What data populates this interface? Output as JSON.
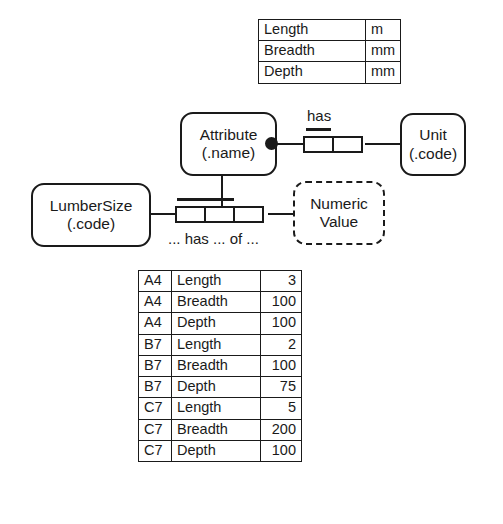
{
  "diagram": {
    "notation": "ORM",
    "line_color": "#1a1a1a",
    "background": "#ffffff"
  },
  "unit_table": {
    "columns": [
      "attribute",
      "unit"
    ],
    "rows": [
      {
        "attribute": "Length",
        "unit": "m"
      },
      {
        "attribute": "Breadth",
        "unit": "mm"
      },
      {
        "attribute": "Depth",
        "unit": "mm"
      }
    ]
  },
  "object_types": {
    "attribute": {
      "name": "Attribute",
      "reference": "(.name)",
      "kind": "entity"
    },
    "unit": {
      "name": "Unit",
      "reference": "(.code)",
      "kind": "entity"
    },
    "lumbersize": {
      "name": "LumberSize",
      "reference": "(.code)",
      "kind": "entity"
    },
    "numeric_value": {
      "name": "Numeric",
      "reference": "Value",
      "kind": "value"
    }
  },
  "predicates": {
    "has": {
      "label": "has",
      "roles": 2,
      "uniqueness_span": 1
    },
    "ternary": {
      "label": "... has ... of ...",
      "roles": 3,
      "uniqueness_span": 2
    }
  },
  "constraints": {
    "mandatory_role": "mandatory-dot"
  },
  "population_table": {
    "columns": [
      "code",
      "attribute",
      "value"
    ],
    "rows": [
      {
        "code": "A4",
        "attribute": "Length",
        "value": "3"
      },
      {
        "code": "A4",
        "attribute": "Breadth",
        "value": "100"
      },
      {
        "code": "A4",
        "attribute": "Depth",
        "value": "100"
      },
      {
        "code": "B7",
        "attribute": "Length",
        "value": "2"
      },
      {
        "code": "B7",
        "attribute": "Breadth",
        "value": "100"
      },
      {
        "code": "B7",
        "attribute": "Depth",
        "value": "75"
      },
      {
        "code": "C7",
        "attribute": "Length",
        "value": "5"
      },
      {
        "code": "C7",
        "attribute": "Breadth",
        "value": "200"
      },
      {
        "code": "C7",
        "attribute": "Depth",
        "value": "100"
      }
    ]
  }
}
